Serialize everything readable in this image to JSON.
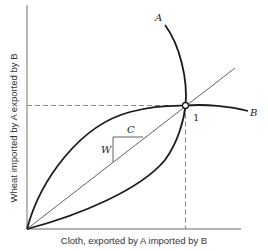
{
  "figure": {
    "x_axis_label": "Cloth, exported by A imported by B",
    "y_axis_label": "Wheat imported by A exported by B",
    "curve_labels": {
      "A": "A",
      "B": "B"
    },
    "equilibrium_label": "1",
    "triangle_labels": {
      "W": "W",
      "C": "C"
    }
  },
  "colors": {
    "axis": "#9a9a9a",
    "curve": "#1a1a1a",
    "dashed": "#8a8a8a"
  }
}
